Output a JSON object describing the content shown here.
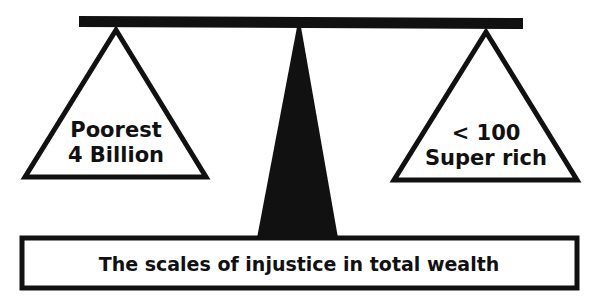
{
  "diagram": {
    "type": "balance-scale",
    "left_pan": {
      "line1": "Poorest",
      "line2": "4 Billion"
    },
    "right_pan": {
      "line1": "< 100",
      "line2": "Super rich"
    },
    "base_caption": "The scales of injustice in total wealth",
    "colors": {
      "ink": "#111111",
      "background": "#ffffff"
    }
  }
}
